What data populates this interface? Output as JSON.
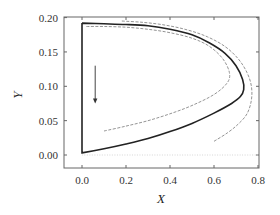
{
  "chart_data": {
    "type": "line",
    "title": "",
    "xlabel": "X",
    "ylabel": "Y",
    "xlim": [
      -0.08,
      0.8
    ],
    "ylim": [
      -0.02,
      0.2
    ],
    "x_ticks": [
      "0.0",
      "0.2",
      "0.4",
      "0.6",
      "0.8"
    ],
    "y_ticks": [
      "0.00",
      "0.05",
      "0.10",
      "0.15",
      "0.20"
    ],
    "grid": false,
    "legend": null,
    "annotations": [
      {
        "type": "arrow",
        "direction": "down",
        "x": 0.06,
        "y_from": 0.13,
        "y_to": 0.075
      }
    ],
    "series": [
      {
        "name": "solid-trajectory",
        "style": "solid",
        "color": "#222222",
        "points": [
          [
            0.0,
            0.192
          ],
          [
            0.0,
            0.003
          ],
          [
            0.1,
            0.009
          ],
          [
            0.2,
            0.016
          ],
          [
            0.3,
            0.024
          ],
          [
            0.4,
            0.034
          ],
          [
            0.5,
            0.046
          ],
          [
            0.6,
            0.061
          ],
          [
            0.68,
            0.075
          ],
          [
            0.72,
            0.085
          ],
          [
            0.735,
            0.095
          ],
          [
            0.73,
            0.11
          ],
          [
            0.7,
            0.13
          ],
          [
            0.65,
            0.148
          ],
          [
            0.58,
            0.163
          ],
          [
            0.5,
            0.175
          ],
          [
            0.4,
            0.183
          ],
          [
            0.3,
            0.188
          ],
          [
            0.2,
            0.19
          ],
          [
            0.1,
            0.191
          ],
          [
            0.0,
            0.192
          ]
        ]
      },
      {
        "name": "inner-dashed",
        "style": "dashed",
        "color": "#888888",
        "points": [
          [
            0.1,
            0.035
          ],
          [
            0.2,
            0.042
          ],
          [
            0.3,
            0.05
          ],
          [
            0.4,
            0.06
          ],
          [
            0.5,
            0.072
          ],
          [
            0.6,
            0.088
          ],
          [
            0.66,
            0.105
          ],
          [
            0.67,
            0.12
          ],
          [
            0.64,
            0.14
          ],
          [
            0.58,
            0.158
          ],
          [
            0.5,
            0.17
          ],
          [
            0.4,
            0.178
          ],
          [
            0.3,
            0.183
          ],
          [
            0.2,
            0.186
          ],
          [
            0.1,
            0.187
          ],
          [
            0.02,
            0.187
          ]
        ]
      },
      {
        "name": "outer-dashed",
        "style": "dashed",
        "color": "#888888",
        "points": [
          [
            0.6,
            0.02
          ],
          [
            0.66,
            0.032
          ],
          [
            0.71,
            0.045
          ],
          [
            0.75,
            0.06
          ],
          [
            0.77,
            0.08
          ],
          [
            0.77,
            0.1
          ],
          [
            0.75,
            0.12
          ],
          [
            0.71,
            0.14
          ],
          [
            0.65,
            0.158
          ],
          [
            0.57,
            0.172
          ],
          [
            0.48,
            0.182
          ],
          [
            0.38,
            0.189
          ],
          [
            0.28,
            0.193
          ],
          [
            0.18,
            0.195
          ]
        ]
      },
      {
        "name": "baseline-dotted",
        "style": "dotted",
        "color": "#cccccc",
        "points": [
          [
            0.0,
            0.0
          ],
          [
            0.8,
            0.0
          ]
        ]
      }
    ]
  }
}
